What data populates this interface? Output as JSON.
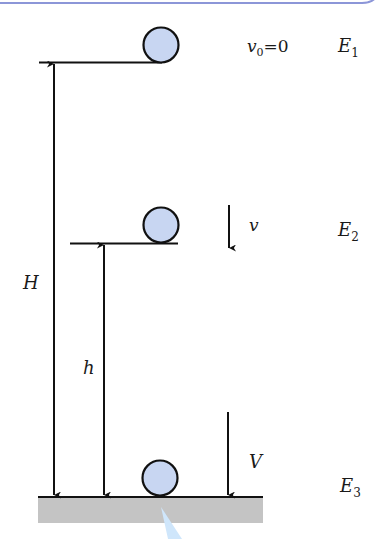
{
  "diagram": {
    "type": "energy-conservation-free-fall",
    "colors": {
      "ball_fill": "#c8d6f2",
      "ball_stroke": "#111111",
      "line": "#111111",
      "ground": "#c4c4c4",
      "frame": "#8c96d8",
      "wedge": "#cfe6fb"
    },
    "levels": [
      {
        "name": "top",
        "velocity_symbol": "v",
        "velocity_sub": "0",
        "velocity_eq": "=0",
        "energy_symbol": "E",
        "energy_sub": "1"
      },
      {
        "name": "middle",
        "velocity_symbol": "v",
        "energy_symbol": "E",
        "energy_sub": "2"
      },
      {
        "name": "ground",
        "velocity_symbol": "V",
        "energy_symbol": "E",
        "energy_sub": "3"
      }
    ],
    "heights": {
      "total": "H",
      "partial": "h"
    }
  }
}
